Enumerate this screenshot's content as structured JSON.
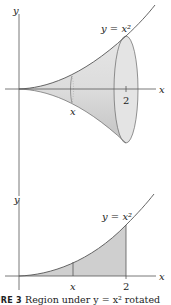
{
  "figure": {
    "top_panel": {
      "axis_y_label": "y",
      "axis_x_label": "x",
      "curve_label": "y = x²",
      "cross_section_label": "x",
      "tick_label": "2",
      "description": "Solid of revolution of y = x² about the x-axis from 0 to 2"
    },
    "bottom_panel": {
      "axis_y_label": "y",
      "axis_x_label": "x",
      "curve_label": "y = x²",
      "marker_label_x": "x",
      "tick_label": "2",
      "description": "Shaded region under y = x² from 0 to 2"
    },
    "caption": {
      "prefix": "URE 3",
      "text": "Region under y = x² rotated"
    }
  },
  "colors": {
    "solid_fill": "#d9d9d9",
    "solid_shade": "#c4c4c4",
    "region_fill": "#cfcfcf",
    "line": "#555555"
  }
}
